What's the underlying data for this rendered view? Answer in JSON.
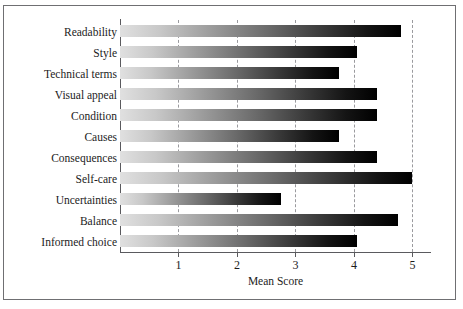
{
  "chart_data": {
    "type": "bar",
    "orientation": "horizontal",
    "title": "",
    "xlabel": "Mean Score",
    "ylabel": "",
    "xlim": [
      0,
      5.3
    ],
    "xticks": [
      1,
      2,
      3,
      4,
      5
    ],
    "xtick_labels": [
      "1",
      "2",
      "3",
      "4",
      "5"
    ],
    "grid": "vertical-dashed",
    "legend": "none",
    "categories": [
      "Readability",
      "Style",
      "Technical terms",
      "Visual appeal",
      "Condition",
      "Causes",
      "Consequences",
      "Self-care",
      "Uncertainties",
      "Balance",
      "Informed choice"
    ],
    "values": [
      4.8,
      4.05,
      3.75,
      4.4,
      4.4,
      3.75,
      4.4,
      5.0,
      2.75,
      4.75,
      4.05
    ],
    "bar_style": {
      "gradient_from": "#e0e0e0",
      "gradient_to": "#000000",
      "bar_height_px": 12
    },
    "axis_color": "#5a5a5e",
    "grid_color": "#9a9a9e",
    "text_color": "#1c1c1c",
    "frame_color": "#6f6f72",
    "background": "#ffffff"
  }
}
